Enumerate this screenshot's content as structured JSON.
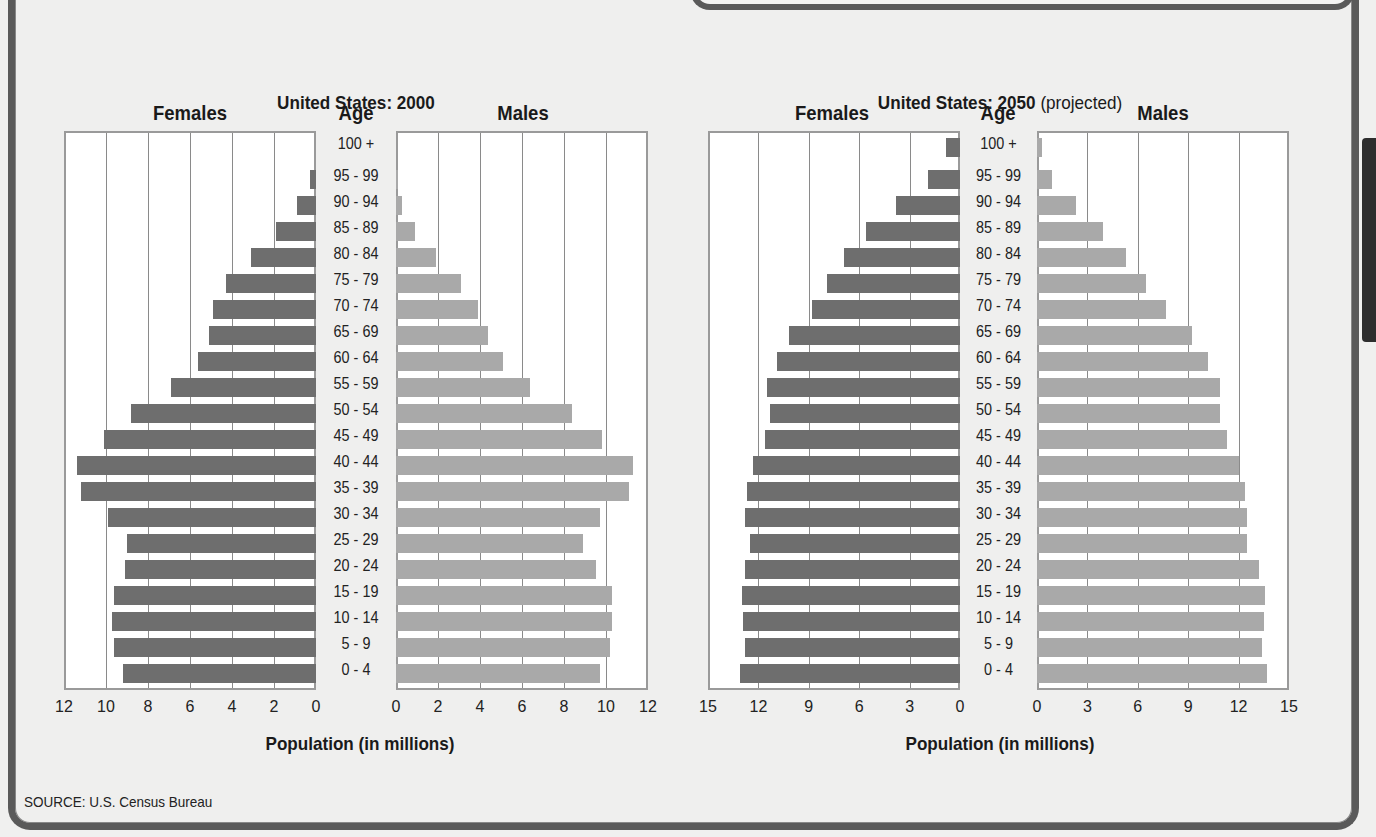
{
  "source": "SOURCE: U.S. Census Bureau",
  "colors": {
    "females": "#6e6e6e",
    "males": "#a9a9a9",
    "plot_bg": "#ffffff",
    "page_bg": "#efefee",
    "frame": "#5a5a5a"
  },
  "charts": [
    {
      "title_bold": "United States: 2000",
      "title_normal": "",
      "left_header": "Females",
      "center_header": "Age",
      "right_header": "Males",
      "xlabel": "Population (in millions)",
      "female_ticks": [
        "12",
        "10",
        "8",
        "6",
        "4",
        "2",
        "0"
      ],
      "male_ticks": [
        "0",
        "2",
        "4",
        "6",
        "8",
        "10",
        "12"
      ]
    },
    {
      "title_bold": "United States: 2050",
      "title_normal": " (projected)",
      "left_header": "Females",
      "center_header": "Age",
      "right_header": "Males",
      "xlabel": "Population (in millions)",
      "female_ticks": [
        "15",
        "12",
        "9",
        "6",
        "3",
        "0"
      ],
      "male_ticks": [
        "0",
        "3",
        "6",
        "9",
        "12",
        "15"
      ]
    }
  ],
  "chart_data": [
    {
      "type": "bar",
      "orientation": "horizontal",
      "subtype": "population-pyramid",
      "title": "United States: 2000",
      "xlabel": "Population (in millions)",
      "ylabel": "Age",
      "xlim": [
        0,
        12
      ],
      "x_ticks": [
        0,
        2,
        4,
        6,
        8,
        10,
        12
      ],
      "grid": true,
      "legend": [
        "Females",
        "Males"
      ],
      "categories": [
        "100 +",
        "95 - 99",
        "90 - 94",
        "85 - 89",
        "80 - 84",
        "75 - 79",
        "70 - 74",
        "65 - 69",
        "60 - 64",
        "55 - 59",
        "50 - 54",
        "45 - 49",
        "40 - 44",
        "35 - 39",
        "30 - 34",
        "25 - 29",
        "20 - 24",
        "15 - 19",
        "10 - 14",
        "5 - 9",
        "0 - 4"
      ],
      "series": [
        {
          "name": "Females",
          "values": [
            0.0,
            0.3,
            0.9,
            1.9,
            3.1,
            4.3,
            4.9,
            5.1,
            5.6,
            6.9,
            8.8,
            10.1,
            11.4,
            11.2,
            9.9,
            9.0,
            9.1,
            9.6,
            9.7,
            9.6,
            9.2
          ]
        },
        {
          "name": "Males",
          "values": [
            0.0,
            0.1,
            0.3,
            0.9,
            1.9,
            3.1,
            3.9,
            4.4,
            5.1,
            6.4,
            8.4,
            9.8,
            11.3,
            11.1,
            9.7,
            8.9,
            9.5,
            10.3,
            10.3,
            10.2,
            9.7
          ]
        }
      ]
    },
    {
      "type": "bar",
      "orientation": "horizontal",
      "subtype": "population-pyramid",
      "title": "United States: 2050 (projected)",
      "xlabel": "Population (in millions)",
      "ylabel": "Age",
      "xlim": [
        0,
        15
      ],
      "x_ticks": [
        0,
        3,
        6,
        9,
        12,
        15
      ],
      "grid": true,
      "legend": [
        "Females",
        "Males"
      ],
      "categories": [
        "100 +",
        "95 - 99",
        "90 - 94",
        "85 - 89",
        "80 - 84",
        "75 - 79",
        "70 - 74",
        "65 - 69",
        "60 - 64",
        "55 - 59",
        "50 - 54",
        "45 - 49",
        "40 - 44",
        "35 - 39",
        "30 - 34",
        "25 - 29",
        "20 - 24",
        "15 - 19",
        "10 - 14",
        "5 - 9",
        "0 - 4"
      ],
      "series": [
        {
          "name": "Females",
          "values": [
            0.85,
            1.9,
            3.8,
            5.6,
            6.9,
            7.9,
            8.8,
            10.2,
            10.9,
            11.5,
            11.3,
            11.6,
            12.3,
            12.7,
            12.8,
            12.5,
            12.8,
            13.0,
            12.9,
            12.8,
            13.1
          ]
        },
        {
          "name": "Males",
          "values": [
            0.3,
            0.9,
            2.3,
            3.9,
            5.3,
            6.5,
            7.7,
            9.2,
            10.2,
            10.9,
            10.9,
            11.3,
            12.0,
            12.4,
            12.5,
            12.5,
            13.2,
            13.6,
            13.5,
            13.4,
            13.7
          ]
        }
      ]
    }
  ]
}
